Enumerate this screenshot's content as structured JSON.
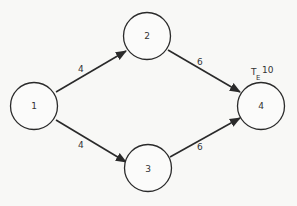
{
  "diagram": {
    "type": "network-activity-graph",
    "nodes": [
      {
        "id": "1",
        "label": "1",
        "cx": 34,
        "cy": 106
      },
      {
        "id": "2",
        "label": "2",
        "cx": 147,
        "cy": 36
      },
      {
        "id": "3",
        "label": "3",
        "cx": 148,
        "cy": 168
      },
      {
        "id": "4",
        "label": "4",
        "cx": 261,
        "cy": 106
      }
    ],
    "edges": [
      {
        "from": "1",
        "to": "2",
        "label": "4"
      },
      {
        "from": "1",
        "to": "3",
        "label": "4"
      },
      {
        "from": "2",
        "to": "4",
        "label": "6"
      },
      {
        "from": "3",
        "to": "4",
        "label": "6"
      }
    ],
    "annotation": {
      "node": "4",
      "symbol": "T",
      "subscript": "E",
      "value": "10"
    }
  },
  "colors": {
    "background": "#f8f8f6",
    "stroke": "#2a2a2a"
  }
}
